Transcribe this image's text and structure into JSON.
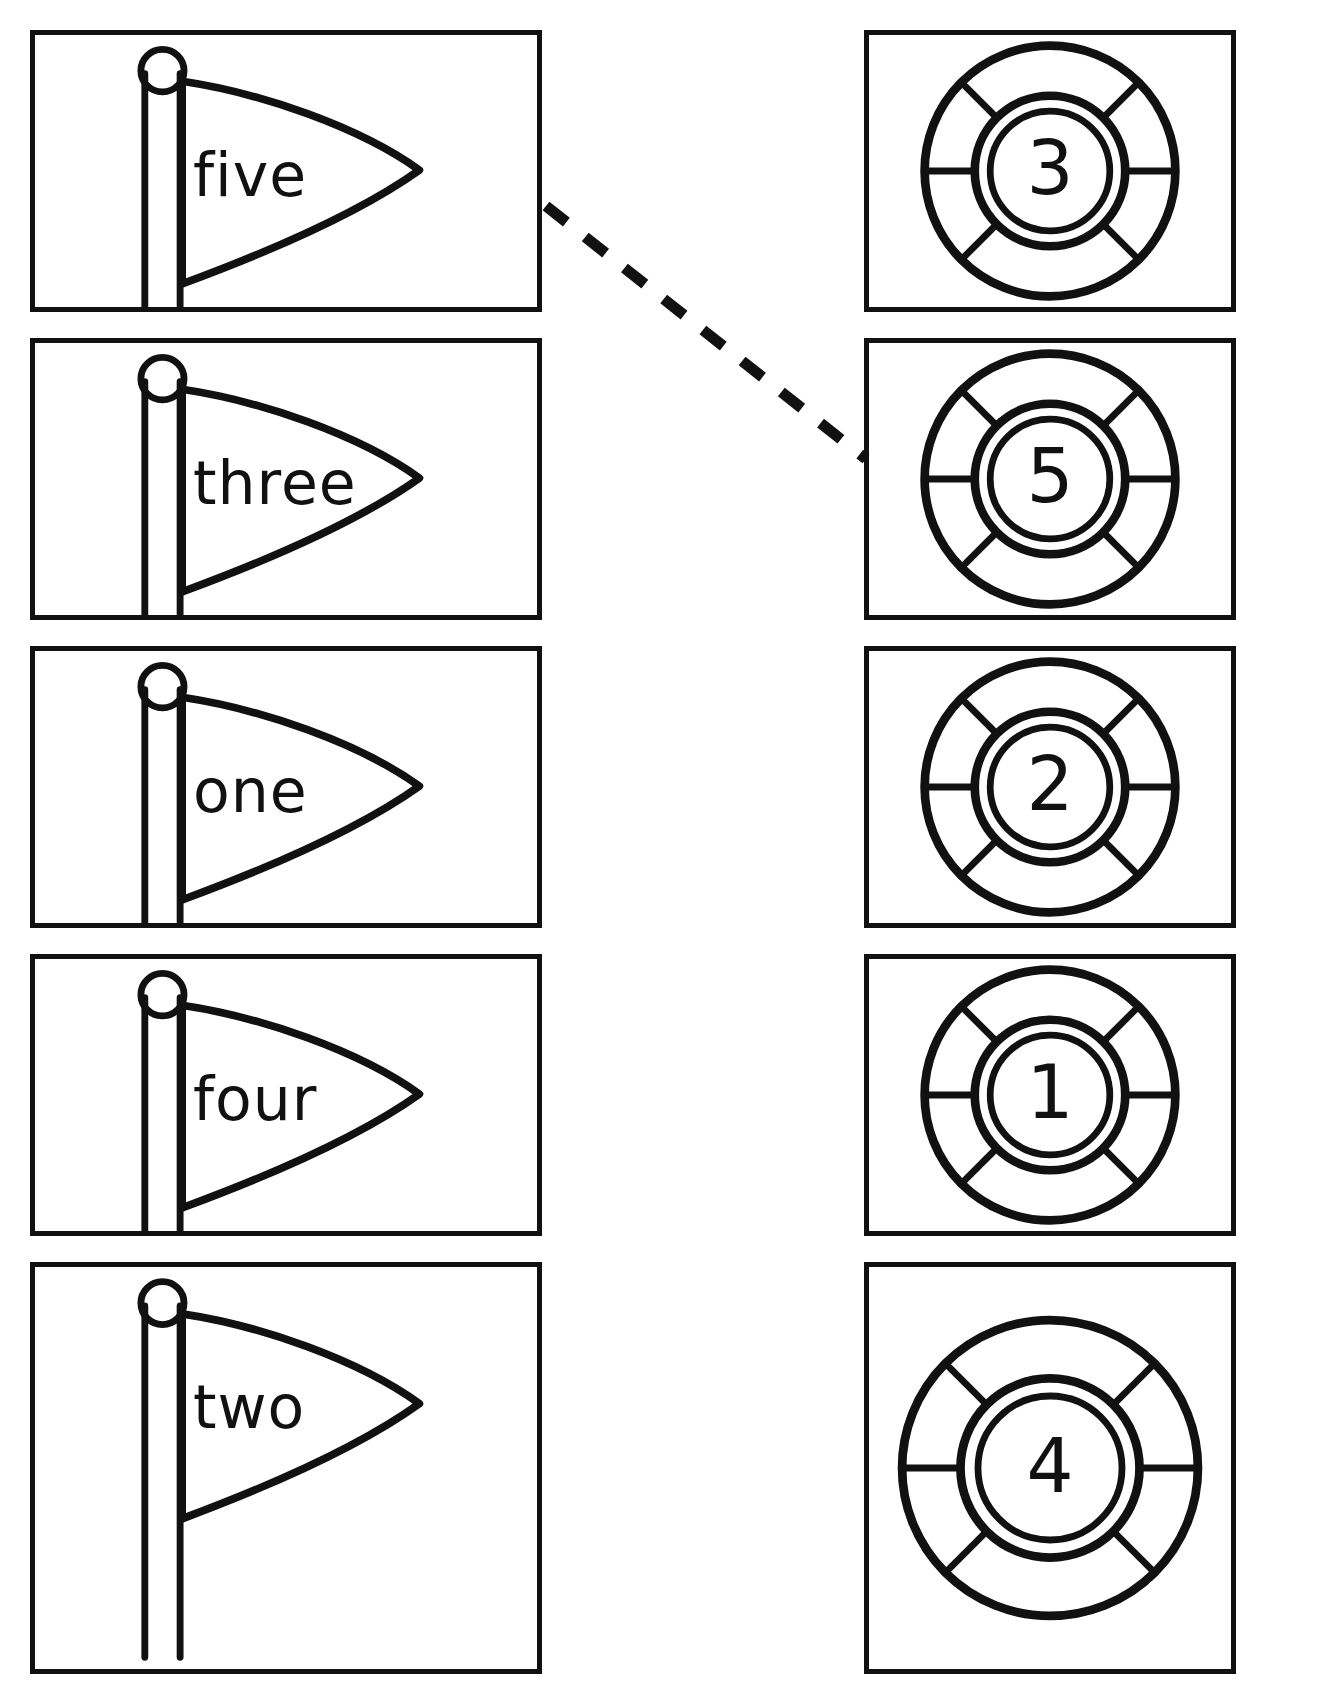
{
  "page": {
    "background_color": "#ffffff",
    "ink_color": "#111111",
    "width": 1344,
    "height": 1702
  },
  "left_column": {
    "label": "number-word-flags",
    "items": [
      {
        "word": "five",
        "icon": "pennant-flag-icon",
        "box": {
          "x": 30,
          "y": 30,
          "w": 512,
          "h": 282
        }
      },
      {
        "word": "three",
        "icon": "pennant-flag-icon",
        "box": {
          "x": 30,
          "y": 338,
          "w": 512,
          "h": 282
        }
      },
      {
        "word": "one",
        "icon": "pennant-flag-icon",
        "box": {
          "x": 30,
          "y": 646,
          "w": 512,
          "h": 282
        }
      },
      {
        "word": "four",
        "icon": "pennant-flag-icon",
        "box": {
          "x": 30,
          "y": 954,
          "w": 512,
          "h": 282
        }
      },
      {
        "word": "two",
        "icon": "pennant-flag-icon",
        "box": {
          "x": 30,
          "y": 1262,
          "w": 512,
          "h": 412
        }
      }
    ]
  },
  "right_column": {
    "label": "numeral-life-rings",
    "items": [
      {
        "numeral": "3",
        "icon": "life-ring-icon",
        "box": {
          "x": 864,
          "y": 30,
          "w": 372,
          "h": 282
        }
      },
      {
        "numeral": "5",
        "icon": "life-ring-icon",
        "box": {
          "x": 864,
          "y": 338,
          "w": 372,
          "h": 282
        }
      },
      {
        "numeral": "2",
        "icon": "life-ring-icon",
        "box": {
          "x": 864,
          "y": 646,
          "w": 372,
          "h": 282
        }
      },
      {
        "numeral": "1",
        "icon": "life-ring-icon",
        "box": {
          "x": 864,
          "y": 954,
          "w": 372,
          "h": 282
        }
      },
      {
        "numeral": "4",
        "icon": "life-ring-icon",
        "box": {
          "x": 864,
          "y": 1262,
          "w": 372,
          "h": 412
        }
      }
    ]
  },
  "connections": [
    {
      "name": "match-line-five-to-5",
      "from_word": "five",
      "to_numeral": "5",
      "style": "dashed",
      "x1": 546,
      "y1": 206,
      "x2": 866,
      "y2": 459
    }
  ]
}
